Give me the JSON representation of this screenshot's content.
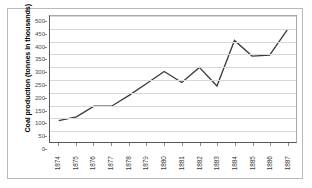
{
  "chart_data": {
    "type": "line",
    "title": "",
    "xlabel": "",
    "ylabel": "Coal production (tonnes in thousands)",
    "categories": [
      "1874",
      "1875",
      "1876",
      "1877",
      "1878",
      "1879",
      "1880",
      "1881",
      "1882",
      "1883",
      "1884",
      "1885",
      "1886",
      "1887"
    ],
    "values": [
      85,
      100,
      142,
      142,
      185,
      232,
      280,
      236,
      296,
      222,
      403,
      341,
      345,
      445
    ],
    "series": [
      {
        "name": "Coal production",
        "values": [
          85,
          100,
          142,
          142,
          185,
          232,
          280,
          236,
          296,
          222,
          403,
          341,
          345,
          445
        ]
      }
    ],
    "ylim": [
      0,
      500
    ],
    "yticks": [
      0,
      50,
      100,
      150,
      200,
      250,
      300,
      350,
      400,
      450,
      500
    ],
    "ytick_labels": [
      "0",
      "50",
      "100",
      "150",
      "200",
      "250",
      "300",
      "350",
      "400",
      "450",
      "500"
    ],
    "grid": true,
    "grid_axis": "y",
    "legend": false,
    "legend_position": "none",
    "line_color": "#3a3a3a",
    "grid_color": "#d8d8d8",
    "axis_color": "#595959",
    "background_color": "#ffffff",
    "markers": false
  }
}
